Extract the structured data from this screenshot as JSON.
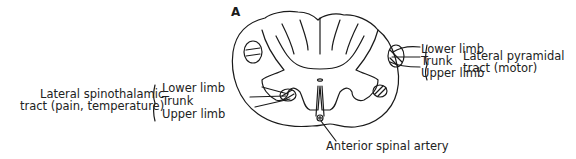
{
  "figure": {
    "panel_label": "A"
  },
  "right_labels": {
    "items": [
      "Lower limb",
      "Trunk",
      "Upper limb"
    ],
    "tract": [
      "Lateral pyramidal",
      "tract (motor)"
    ]
  },
  "left_labels": {
    "items": [
      "Lower limb",
      "Trunk",
      "Upper limb"
    ],
    "tract": [
      "Lateral spinothalamic",
      "tract (pain, temperature)"
    ]
  },
  "bottom_label": "Anterior spinal artery"
}
